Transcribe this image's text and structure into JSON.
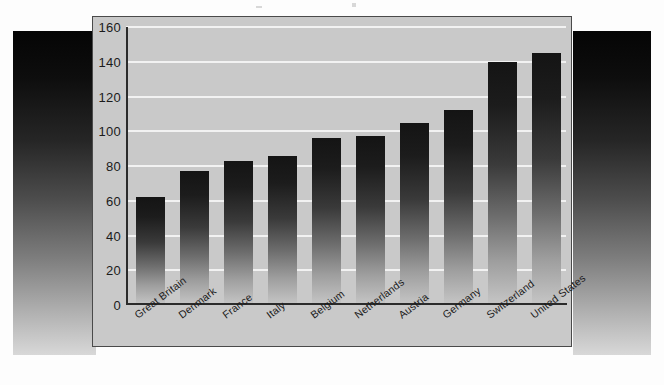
{
  "chart_data": {
    "type": "bar",
    "title": "",
    "subtitle": "",
    "xlabel": "",
    "ylabel": "",
    "categories": [
      "Great Britain",
      "Denmark",
      "France",
      "Italy",
      "Belgium",
      "Netherlands",
      "Austria",
      "Germany",
      "Switzerland",
      "United States"
    ],
    "values": [
      62,
      77,
      83,
      86,
      96,
      97,
      105,
      112,
      140,
      145
    ],
    "ylim": [
      0,
      160
    ],
    "ytick_step": 20,
    "yticks": [
      "160",
      "140",
      "120",
      "100",
      "80",
      "60",
      "40",
      "20",
      "0"
    ],
    "grid": true,
    "legend": "none",
    "orientation": "vertical",
    "bar_style": "vertical-gradient-dark-to-light",
    "label_rotation_deg": -37
  },
  "figure": {
    "panel_background": "#c9c9c9",
    "panel_border": "#4a4a4a",
    "gridline_color": "#f2f2f2",
    "axis_color": "#2b2b2b",
    "bar_top_color": "#141414",
    "bar_bottom_color": "#c6c6c6",
    "page_background": "#fdfdfd",
    "slab_top_color": "#050505",
    "slab_bottom_color": "#d8d8d8"
  }
}
